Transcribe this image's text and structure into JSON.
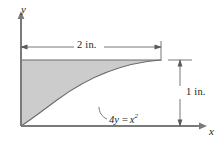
{
  "figure": {
    "type": "geometry-diagram",
    "colors": {
      "shaded_region": "#cccccc",
      "line": "#5a5a5a",
      "text": "#1c1c1c",
      "background": "#ffffff"
    },
    "axes": {
      "y_label": "y",
      "x_label": "x"
    },
    "dimensions": {
      "horizontal": "2 in.",
      "vertical": "1 in."
    },
    "curve": {
      "equation_lhs": "4y",
      "equation_op": "=",
      "equation_var": "x",
      "equation_exp": "2",
      "equation_full": "4y = x²"
    }
  }
}
